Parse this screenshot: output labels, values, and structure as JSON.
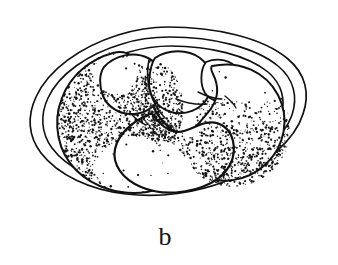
{
  "figure": {
    "label": "b",
    "caption_label": "b",
    "background_color": "#ffffff",
    "ink_color": "#111111",
    "stipple_color": "#151515",
    "line_weight_outer": 1.6,
    "line_weight_inner": 1.5,
    "line_weight_lobe": 2.0
  },
  "membranes": {
    "name": "concentric-oval-membranes",
    "count": 3,
    "rings": [
      {
        "name": "outer-membrane",
        "cx": 168,
        "cy": 117,
        "rx": 140,
        "ry": 90,
        "rotate": -1.5,
        "stroke_width": 1.7
      },
      {
        "name": "middle-membrane",
        "cx": 169,
        "cy": 117,
        "rx": 126,
        "ry": 80,
        "rotate": -1.5,
        "stroke_width": 1.6
      },
      {
        "name": "inner-membrane",
        "cx": 170,
        "cy": 116,
        "rx": 113,
        "ry": 71,
        "rotate": -1.5,
        "stroke_width": 1.6
      }
    ]
  },
  "embryo": {
    "name": "embryo-mass",
    "lobes": [
      {
        "name": "lobe-left-large",
        "shading": "dense-stipple",
        "region": "left"
      },
      {
        "name": "lobe-upper-left-small",
        "shading": "clear",
        "region": "upper-left"
      },
      {
        "name": "lobe-upper-center",
        "shading": "clear",
        "region": "upper-center"
      },
      {
        "name": "lobe-right-crescent",
        "shading": "stipple-lower-edge",
        "region": "right"
      },
      {
        "name": "lobe-lower-center-kidney",
        "shading": "clear",
        "region": "lower-center"
      }
    ],
    "stipple_dot_count": 1150,
    "stipple_dot_radius_min": 0.45,
    "stipple_dot_radius_max": 1.25
  },
  "colors": {
    "paper": "#ffffff",
    "ink": "#111111",
    "caption": "#131313"
  }
}
